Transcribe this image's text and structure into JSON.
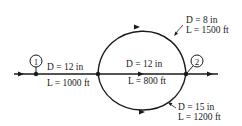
{
  "diagram": {
    "type": "pipe-network",
    "nodes": [
      {
        "id": "1",
        "label": "1"
      },
      {
        "id": "2",
        "label": "2"
      }
    ],
    "pipes": {
      "inlet": {
        "D": "D = 12 in",
        "L": "L = 1000 ft"
      },
      "upper": {
        "D": "D = 8 in",
        "L": "L = 1500 ft"
      },
      "middle": {
        "D": "D = 12 in",
        "L": "L = 800 ft"
      },
      "lower": {
        "D": "D = 15 in",
        "L": "L = 1200 ft"
      }
    },
    "colors": {
      "line": "#1a1a1a",
      "background": "#ffffff"
    }
  }
}
